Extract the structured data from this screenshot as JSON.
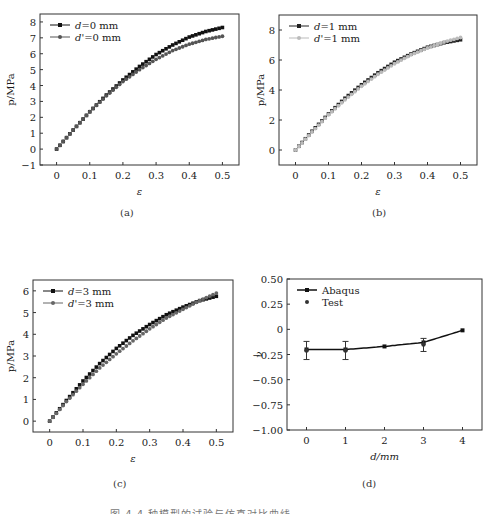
{
  "chart_data": [
    {
      "id": "a",
      "type": "scatter",
      "caption": "(a)",
      "xlabel": "ε",
      "ylabel": "p/MPa",
      "xlim": [
        -0.05,
        0.55
      ],
      "ylim": [
        -1,
        8.5
      ],
      "xticks": [
        0,
        0.1,
        0.2,
        0.3,
        0.4,
        0.5
      ],
      "xtick_labels": [
        "0",
        "0.1",
        "0.2",
        "0.3",
        "0.4",
        "0.5"
      ],
      "yticks": [
        -1,
        0,
        1,
        2,
        3,
        4,
        5,
        6,
        7,
        8
      ],
      "ytick_labels": [
        "−1",
        "0",
        "1",
        "2",
        "3",
        "4",
        "5",
        "6",
        "7",
        "8"
      ],
      "legend_position": "upper left",
      "series": [
        {
          "name": "d=0 mm",
          "color": "#111111",
          "marker": "square",
          "x": [
            0,
            0.05,
            0.1,
            0.15,
            0.2,
            0.25,
            0.3,
            0.35,
            0.4,
            0.45,
            0.5
          ],
          "y": [
            0,
            1.2,
            2.35,
            3.4,
            4.35,
            5.2,
            5.95,
            6.55,
            7.05,
            7.4,
            7.65
          ]
        },
        {
          "name": "d'=0 mm",
          "color": "#555555",
          "marker": "circle",
          "x": [
            0,
            0.05,
            0.1,
            0.15,
            0.2,
            0.25,
            0.3,
            0.35,
            0.4,
            0.45,
            0.5
          ],
          "y": [
            0,
            1.2,
            2.35,
            3.35,
            4.25,
            5.0,
            5.65,
            6.2,
            6.6,
            6.9,
            7.1
          ]
        }
      ]
    },
    {
      "id": "b",
      "type": "scatter",
      "caption": "(b)",
      "xlabel": "ε",
      "ylabel": "p/MPa",
      "xlim": [
        -0.05,
        0.55
      ],
      "ylim": [
        -1,
        9
      ],
      "xticks": [
        0,
        0.1,
        0.2,
        0.3,
        0.4,
        0.5
      ],
      "xtick_labels": [
        "0",
        "0.1",
        "0.2",
        "0.3",
        "0.4",
        "0.5"
      ],
      "yticks": [
        0,
        2,
        4,
        6,
        8
      ],
      "ytick_labels": [
        "0",
        "2",
        "4",
        "6",
        "8"
      ],
      "legend_position": "upper left",
      "series": [
        {
          "name": "d=1 mm",
          "color": "#222222",
          "marker": "square",
          "x": [
            0,
            0.05,
            0.1,
            0.15,
            0.2,
            0.25,
            0.3,
            0.35,
            0.4,
            0.45,
            0.5
          ],
          "y": [
            0,
            1.25,
            2.4,
            3.45,
            4.35,
            5.15,
            5.85,
            6.4,
            6.85,
            7.15,
            7.35
          ]
        },
        {
          "name": "d'=1 mm",
          "color": "#bbbbbb",
          "marker": "circle",
          "x": [
            0,
            0.05,
            0.1,
            0.15,
            0.2,
            0.25,
            0.3,
            0.35,
            0.4,
            0.45,
            0.5
          ],
          "y": [
            0,
            1.2,
            2.35,
            3.35,
            4.25,
            5.05,
            5.75,
            6.35,
            6.8,
            7.2,
            7.5
          ]
        }
      ]
    },
    {
      "id": "c",
      "type": "scatter",
      "caption": "(c)",
      "xlabel": "ε",
      "ylabel": "p/MPa",
      "xlim": [
        -0.05,
        0.55
      ],
      "ylim": [
        -0.5,
        6.5
      ],
      "xticks": [
        0,
        0.1,
        0.2,
        0.3,
        0.4,
        0.5
      ],
      "xtick_labels": [
        "0",
        "0.1",
        "0.2",
        "0.3",
        "0.4",
        "0.5"
      ],
      "yticks": [
        0,
        1,
        2,
        3,
        4,
        5,
        6
      ],
      "ytick_labels": [
        "0",
        "1",
        "2",
        "3",
        "4",
        "5",
        "6"
      ],
      "legend_position": "upper left",
      "series": [
        {
          "name": "d=3 mm",
          "color": "#111111",
          "marker": "square",
          "x": [
            0,
            0.05,
            0.1,
            0.15,
            0.2,
            0.25,
            0.3,
            0.35,
            0.4,
            0.45,
            0.5
          ],
          "y": [
            0,
            0.95,
            1.85,
            2.65,
            3.35,
            3.95,
            4.45,
            4.9,
            5.25,
            5.55,
            5.75
          ]
        },
        {
          "name": "d'=3 mm",
          "color": "#666666",
          "marker": "circle",
          "x": [
            0,
            0.05,
            0.1,
            0.15,
            0.2,
            0.25,
            0.3,
            0.35,
            0.4,
            0.45,
            0.5
          ],
          "y": [
            0,
            0.9,
            1.7,
            2.45,
            3.1,
            3.7,
            4.25,
            4.75,
            5.15,
            5.55,
            5.9
          ]
        }
      ]
    },
    {
      "id": "d",
      "type": "line",
      "caption": "(d)",
      "xlabel": "d/mm",
      "ylabel": "ν",
      "xlim": [
        -0.5,
        4.5
      ],
      "ylim": [
        -1.0,
        0.5
      ],
      "xticks": [
        0,
        1,
        2,
        3,
        4
      ],
      "xtick_labels": [
        "0",
        "1",
        "2",
        "3",
        "4"
      ],
      "yticks": [
        0.5,
        0.25,
        0,
        -0.25,
        -0.5,
        -0.75,
        -1.0
      ],
      "ytick_labels": [
        "0.50",
        "0.25",
        "0",
        "−0.25",
        "−0.50",
        "−0.75",
        "−1.00"
      ],
      "legend_position": "upper left",
      "series": [
        {
          "name": "Abaqus",
          "color": "#111111",
          "marker": "square",
          "x": [
            0,
            1,
            2,
            3,
            4
          ],
          "y": [
            -0.2,
            -0.2,
            -0.17,
            -0.13,
            -0.01
          ]
        },
        {
          "name": "Test",
          "color": "#333333",
          "marker": "circle",
          "x": [
            0,
            1,
            3
          ],
          "y": [
            -0.21,
            -0.21,
            -0.15
          ],
          "error_low": [
            -0.3,
            -0.3,
            -0.22
          ],
          "error_high": [
            -0.12,
            -0.12,
            -0.09
          ]
        }
      ]
    }
  ],
  "captions": {
    "a": "(a)",
    "b": "(b)",
    "c": "(c)",
    "d": "(d)"
  },
  "figure_caption": "图 4  4 种模型的试验与仿真对比曲线"
}
